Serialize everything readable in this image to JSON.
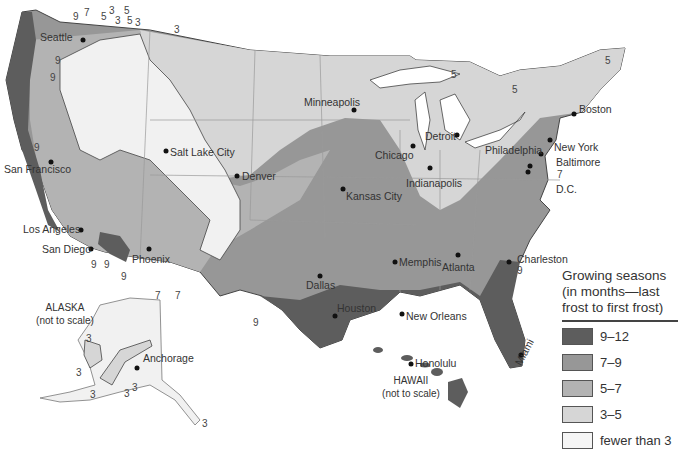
{
  "map": {
    "title": "Growing seasons map of the United States",
    "colors": {
      "c9_12": "#5d5d5d",
      "c7_9": "#979797",
      "c5_7": "#b3b3b3",
      "c3_5": "#d6d6d6",
      "lt3": "#f1f1f1",
      "water": "#ffffff",
      "border": "#444444",
      "state_line": "#9a9a9a"
    },
    "legend": {
      "title": "Growing seasons (in months—last frost to first frost)",
      "items": [
        {
          "label": "9–12",
          "color": "#5d5d5d"
        },
        {
          "label": "7–9",
          "color": "#979797"
        },
        {
          "label": "5–7",
          "color": "#b3b3b3"
        },
        {
          "label": "3–5",
          "color": "#d6d6d6"
        },
        {
          "label": "fewer than 3",
          "color": "#f5f5f5"
        }
      ]
    },
    "cities": [
      {
        "name": "Seattle"
      },
      {
        "name": "San Francisco"
      },
      {
        "name": "Los Angeles"
      },
      {
        "name": "San Diego"
      },
      {
        "name": "Phoenix"
      },
      {
        "name": "Salt Lake City"
      },
      {
        "name": "Denver"
      },
      {
        "name": "Minneapolis"
      },
      {
        "name": "Kansas City"
      },
      {
        "name": "Dallas"
      },
      {
        "name": "Houston"
      },
      {
        "name": "New Orleans"
      },
      {
        "name": "Memphis"
      },
      {
        "name": "Chicago"
      },
      {
        "name": "Detroit"
      },
      {
        "name": "Indianapolis"
      },
      {
        "name": "Atlanta"
      },
      {
        "name": "Charleston"
      },
      {
        "name": "Miami"
      },
      {
        "name": "Philadelphia"
      },
      {
        "name": "New York"
      },
      {
        "name": "Baltimore"
      },
      {
        "name": "D.C."
      },
      {
        "name": "Boston"
      },
      {
        "name": "Anchorage"
      },
      {
        "name": "Honolulu"
      }
    ],
    "insets": {
      "alaska": {
        "title": "ALASKA",
        "note": "(not to scale)"
      },
      "hawaii": {
        "title": "HAWAII",
        "note": "(not to scale)"
      }
    },
    "contour_labels": [
      "9",
      "7",
      "5",
      "3",
      "5",
      "3",
      "5",
      "3",
      "3",
      "9",
      "9",
      "9",
      "9",
      "9",
      "9",
      "7",
      "7",
      "5",
      "5",
      "5",
      "7",
      "9",
      "9",
      "3",
      "3",
      "3",
      "3",
      "3",
      "3"
    ]
  }
}
